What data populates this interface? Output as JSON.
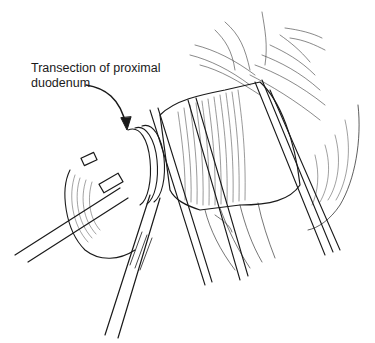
{
  "figure": {
    "annotation": {
      "line1": "Transection of proximal",
      "line2": "duodenum"
    },
    "colors": {
      "background": "#ffffff",
      "ink": "#1a1a1a"
    }
  }
}
